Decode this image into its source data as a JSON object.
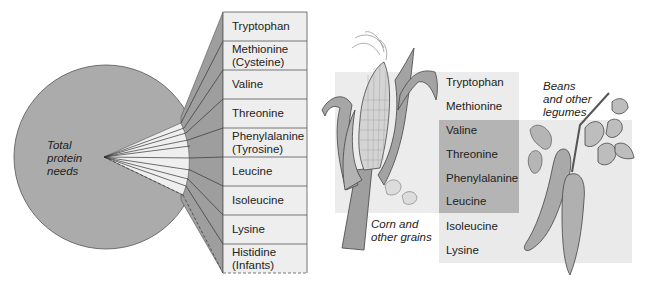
{
  "left_diagram": {
    "circle_label": [
      "Total",
      "protein",
      "needs"
    ],
    "essential_amino_acids": [
      {
        "line1": "Tryptophan",
        "line2": ""
      },
      {
        "line1": "Methionine",
        "line2": "(Cysteine)"
      },
      {
        "line1": "Valine",
        "line2": ""
      },
      {
        "line1": "Threonine",
        "line2": ""
      },
      {
        "line1": "Phenylalanine",
        "line2": "(Tyrosine)"
      },
      {
        "line1": "Leucine",
        "line2": ""
      },
      {
        "line1": "Isoleucine",
        "line2": ""
      },
      {
        "line1": "Lysine",
        "line2": ""
      },
      {
        "line1": "Histidine",
        "line2": "(Infants)"
      }
    ]
  },
  "right_diagram": {
    "corn_label": [
      "Corn and",
      "other grains"
    ],
    "beans_label": [
      "Beans",
      "and other",
      "legumes"
    ],
    "amino_acids": [
      "Tryptophan",
      "Methionine",
      "Valine",
      "Threonine",
      "Phenylalanine",
      "Leucine",
      "Isoleucine",
      "Lysine"
    ],
    "grains_provide": [
      "Tryptophan",
      "Methionine",
      "Valine",
      "Threonine",
      "Phenylalanine",
      "Leucine"
    ],
    "legumes_provide": [
      "Valine",
      "Threonine",
      "Phenylalanine",
      "Leucine",
      "Isoleucine",
      "Lysine"
    ]
  },
  "colors": {
    "circle_fill": "#a9a9a9",
    "wedge_fill": "#eeeeee",
    "fan_fill": "#9d9d9d",
    "table_fill": "#ededed",
    "region_light": "#ececec",
    "region_overlap": "#b3b3b3",
    "outline": "#444444"
  }
}
